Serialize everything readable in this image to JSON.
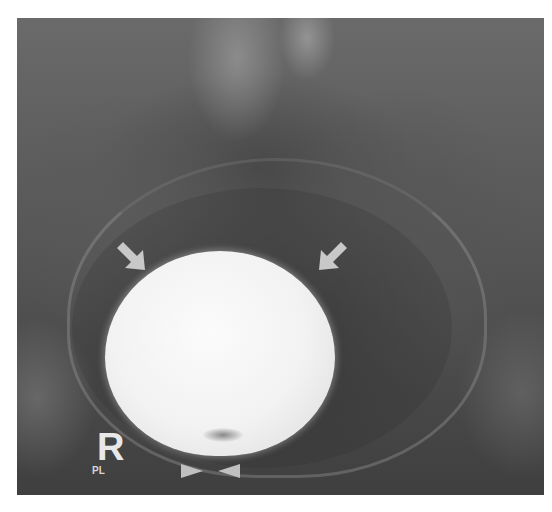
{
  "image": {
    "type": "pelvic radiograph (cystogram)",
    "background": "#ffffff",
    "film_tone_dark": "#3f3f3f",
    "film_tone_light": "#6a6a6a",
    "bladder_fill": "#f2f2f2",
    "annotation_color": "#c8c8c8"
  },
  "markers": {
    "side_letter": "R",
    "side_sublabel": "PL"
  },
  "annotations": {
    "arrows": [
      {
        "name": "arrow-left",
        "direction": "down-right"
      },
      {
        "name": "arrow-right",
        "direction": "down-left"
      }
    ],
    "arrowheads": [
      {
        "name": "arrowhead-left",
        "direction": "right"
      },
      {
        "name": "arrowhead-right",
        "direction": "left"
      }
    ]
  }
}
